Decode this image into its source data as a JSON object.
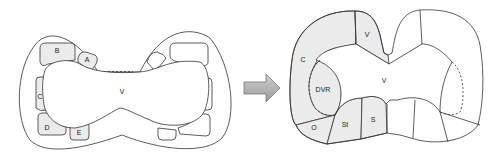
{
  "left_diagram": {
    "labels": {
      "B": "B",
      "A": "A",
      "C": "C",
      "D": "D",
      "E": "E",
      "V": "V"
    }
  },
  "arrow": {
    "color": "#aaaaaa",
    "direction": "right"
  },
  "right_diagram": {
    "labels": {
      "C": "C",
      "V_top": "V",
      "DVR": "DVR",
      "V_center": "V",
      "O": "O",
      "St": "St",
      "S": "S"
    }
  },
  "colors": {
    "shade": "#ebebeb",
    "stroke": "#333333"
  }
}
